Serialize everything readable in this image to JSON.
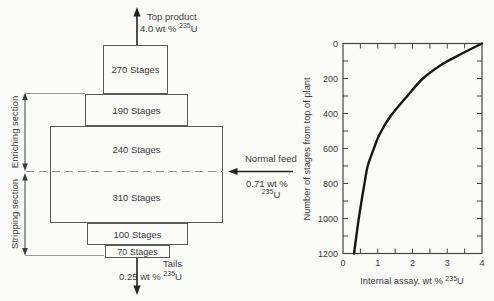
{
  "cascade": {
    "top_product": {
      "line1": "Top product",
      "value": "4.0  wt % ",
      "isotope": "235",
      "element": "U"
    },
    "boxes": [
      {
        "label": "270 Stages"
      },
      {
        "label": "190 Stages"
      },
      {
        "label": "240 Stages"
      },
      {
        "label": "310 Stages"
      },
      {
        "label": "100 Stages"
      },
      {
        "label": "70 Stages"
      }
    ],
    "feed": {
      "line1": "Normal feed",
      "value": "0.71 wt %",
      "isotope": "235",
      "element": "U"
    },
    "tails": {
      "line1": "Tails",
      "value": "0.25 wt % ",
      "isotope": "235",
      "element": "U"
    },
    "enriching_label": "Enriching section",
    "stripping_label": "Stripping section"
  },
  "chart_data": {
    "type": "line",
    "title": "",
    "xlabel_prefix": "Internal assay, wt % ",
    "xlabel_isotope": "235",
    "xlabel_element": "U",
    "ylabel": "Number of stages from top of plant",
    "xlim": [
      0,
      4
    ],
    "ylim": [
      0,
      1200
    ],
    "y_axis_inverted": true,
    "x_ticks": [
      0,
      1,
      2,
      3,
      4
    ],
    "x_minor_tick_step": 0.5,
    "y_ticks": [
      0,
      200,
      400,
      600,
      800,
      1000,
      1200
    ],
    "y_minor_tick_step": 100,
    "grid": false,
    "legend": false,
    "series": [
      {
        "name": "internal-assay-profile",
        "points": [
          [
            4.0,
            0
          ],
          [
            3.3,
            70
          ],
          [
            2.8,
            125
          ],
          [
            2.3,
            200
          ],
          [
            1.85,
            300
          ],
          [
            1.35,
            420
          ],
          [
            1.05,
            520
          ],
          [
            0.87,
            610
          ],
          [
            0.71,
            700
          ],
          [
            0.63,
            785
          ],
          [
            0.49,
            955
          ],
          [
            0.39,
            1090
          ],
          [
            0.32,
            1200
          ]
        ]
      }
    ]
  }
}
